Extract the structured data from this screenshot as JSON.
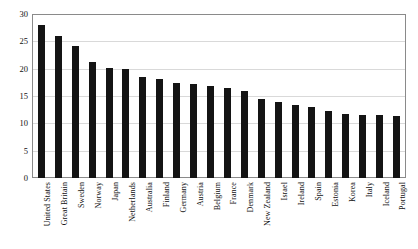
{
  "chart_data": {
    "type": "bar",
    "title": "",
    "xlabel": "",
    "ylabel": "",
    "ylim": [
      0,
      30
    ],
    "yticks": [
      0,
      5,
      10,
      15,
      20,
      25,
      30
    ],
    "grid": true,
    "legend": "none",
    "bar_color": "#141414",
    "categories": [
      "United States",
      "Great Britain",
      "Sweden",
      "Norway",
      "Japan",
      "Netherlands",
      "Australia",
      "Finland",
      "Germany",
      "Austria",
      "Belgium",
      "France",
      "Denmark",
      "New Zealand",
      "Israel",
      "Ireland",
      "Spain",
      "Estonia",
      "Korea",
      "Italy",
      "Iceland",
      "Portugal"
    ],
    "values": [
      28.0,
      26.0,
      24.2,
      21.3,
      20.1,
      19.9,
      18.4,
      18.1,
      17.3,
      17.2,
      16.9,
      16.4,
      15.9,
      14.4,
      13.9,
      13.3,
      13.0,
      12.2,
      11.8,
      11.6,
      11.5,
      11.3
    ]
  }
}
